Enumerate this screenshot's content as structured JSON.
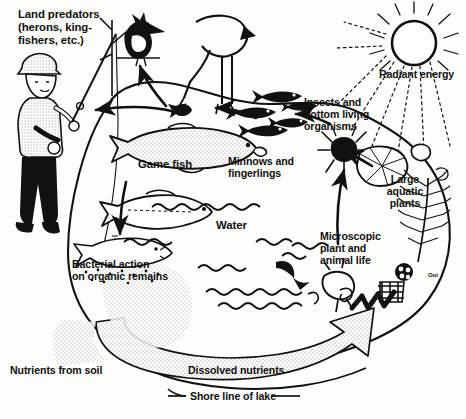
{
  "diagram": {
    "ink_color": "#111111",
    "paper_color": "#fdfdfb",
    "stipple_color": "#cfcfc8",
    "labels": {
      "land_predators": "Land predators\n(herons, king-\nfishers, etc.)",
      "land_predators_line1": "Land predators",
      "land_predators_line2": "(herons, king-",
      "land_predators_line3": "fishers, etc.)",
      "radiant_energy": "Radiant energy",
      "insects_line1": "Insects and",
      "insects_line2": "bottom living",
      "insects_line3": "organisms",
      "game_fish": "Game fish",
      "minnows_line1": "Minnows and",
      "minnows_line2": "fingerlings",
      "large_aquatic_line1": "Large",
      "large_aquatic_line2": "aquatic",
      "large_aquatic_line3": "plants",
      "water": "Water",
      "microscopic_line1": "Microscopic",
      "microscopic_line2": "plant and",
      "microscopic_line3": "animal life",
      "bacterial_line1": "Bacterial action",
      "bacterial_line2": "on organic remains",
      "nutrients_from_soil": "Nutrients from soil",
      "dissolved_nutrients": "Dissolved nutrients",
      "shore_line": "Shore line of lake",
      "signature": "Oui"
    },
    "icons": [
      {
        "name": "fisherman-icon",
        "label": "Land predators"
      },
      {
        "name": "kingfisher-bird-icon",
        "label": "Land predators"
      },
      {
        "name": "heron-bird-icon",
        "label": "Land predators"
      },
      {
        "name": "sun-icon",
        "label": "Radiant energy"
      },
      {
        "name": "game-fish-icon",
        "label": "Game fish"
      },
      {
        "name": "minnow-fish-icon",
        "label": "Minnows and fingerlings"
      },
      {
        "name": "insect-larva-icon",
        "label": "Insects and bottom living organisms"
      },
      {
        "name": "lily-pad-icon",
        "label": "Large aquatic plants"
      },
      {
        "name": "submerged-plant-icon",
        "label": "Large aquatic plants"
      },
      {
        "name": "plankton-icon",
        "label": "Microscopic plant and animal life"
      },
      {
        "name": "dead-fish-icon",
        "label": "Bacterial action on organic remains"
      },
      {
        "name": "water-wave-icon",
        "label": "Water"
      },
      {
        "name": "nutrient-arrow-icon",
        "label": "Dissolved nutrients"
      }
    ],
    "flow_arrows": [
      {
        "name": "arrow-fish-to-fisherman",
        "from": "Game fish",
        "to": "Land predators"
      },
      {
        "name": "arrow-fish-to-kingfisher",
        "from": "Game fish",
        "to": "Land predators"
      },
      {
        "name": "arrow-minnows-to-gamefish",
        "from": "Minnows and fingerlings",
        "to": "Game fish"
      },
      {
        "name": "arrow-insects-to-minnows",
        "from": "Insects and bottom living organisms",
        "to": "Minnows and fingerlings"
      },
      {
        "name": "arrow-plants-to-insects",
        "from": "Large aquatic plants",
        "to": "Insects and bottom living organisms"
      },
      {
        "name": "arrow-microscopic-to-insects",
        "from": "Microscopic plant and animal life",
        "to": "Insects and bottom living organisms"
      },
      {
        "name": "arrow-gamefish-to-bacteria",
        "from": "Game fish",
        "to": "Bacterial action on organic remains"
      },
      {
        "name": "arrow-nutrients-to-plants",
        "from": "Dissolved nutrients",
        "to": "Large aquatic plants"
      }
    ]
  }
}
